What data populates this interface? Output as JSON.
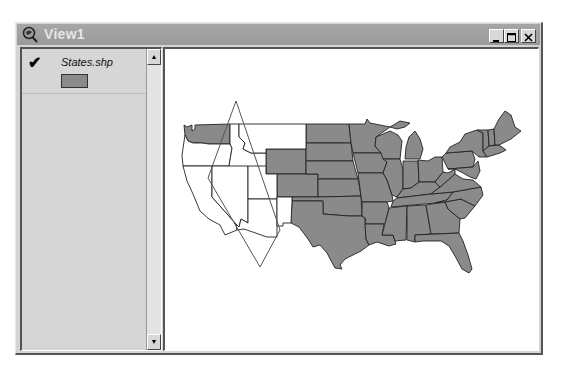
{
  "window": {
    "title": "View1",
    "icon": "magnifier-globe-icon",
    "controls": {
      "minimize": "_",
      "maximize": "□",
      "close": "×"
    }
  },
  "toc": {
    "layers": [
      {
        "name": "States.shp",
        "visible": true,
        "check_glyph": "✔",
        "symbol_color": "#8a8a8a"
      }
    ],
    "scroll_up": "▲",
    "scroll_down": "▼"
  },
  "map": {
    "layer": "States.shp",
    "colors": {
      "selected_fill": "#8a8a8a",
      "unselected_fill": "#ffffff",
      "outline": "#222222",
      "selection_shape": "#555555"
    },
    "selection_polygon": "diamond",
    "unselected_states": [
      "Oregon",
      "Idaho",
      "Montana",
      "California",
      "Nevada",
      "Utah",
      "Arizona",
      "New Mexico"
    ],
    "selected_states_note": "all remaining states shaded"
  }
}
